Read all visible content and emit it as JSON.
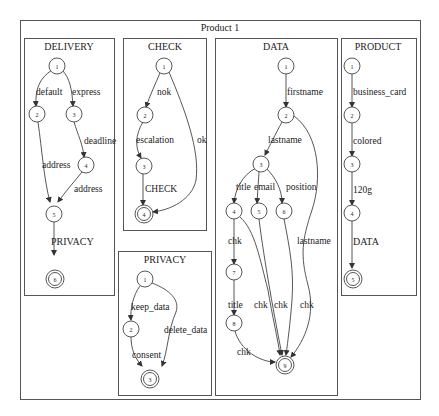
{
  "graph": {
    "title": "Product 1",
    "clusters": [
      {
        "name": "DELIVERY",
        "nodes": [
          {
            "id": "1",
            "final": false
          },
          {
            "id": "2",
            "final": false
          },
          {
            "id": "3",
            "final": false
          },
          {
            "id": "4",
            "final": false
          },
          {
            "id": "5",
            "final": false
          },
          {
            "id": "6",
            "final": true
          }
        ],
        "edges": [
          {
            "from": "1",
            "to": "2",
            "label": "default"
          },
          {
            "from": "1",
            "to": "3",
            "label": "express"
          },
          {
            "from": "3",
            "to": "4",
            "label": "deadline"
          },
          {
            "from": "2",
            "to": "5",
            "label": "address"
          },
          {
            "from": "4",
            "to": "5",
            "label": "address"
          },
          {
            "from": "5",
            "to": "6",
            "label": "PRIVACY"
          }
        ]
      },
      {
        "name": "CHECK",
        "nodes": [
          {
            "id": "1",
            "final": false
          },
          {
            "id": "2",
            "final": false
          },
          {
            "id": "3",
            "final": false
          },
          {
            "id": "4",
            "final": true
          }
        ],
        "edges": [
          {
            "from": "1",
            "to": "2",
            "label": "nok"
          },
          {
            "from": "2",
            "to": "3",
            "label": "escalation"
          },
          {
            "from": "3",
            "to": "4",
            "label": "CHECK"
          },
          {
            "from": "1",
            "to": "4",
            "label": "ok"
          }
        ]
      },
      {
        "name": "PRIVACY",
        "nodes": [
          {
            "id": "1",
            "final": false
          },
          {
            "id": "2",
            "final": false
          },
          {
            "id": "3",
            "final": true
          }
        ],
        "edges": [
          {
            "from": "1",
            "to": "2",
            "label": "keep_data"
          },
          {
            "from": "2",
            "to": "3",
            "label": "consent"
          },
          {
            "from": "1",
            "to": "3",
            "label": "delete_data"
          }
        ]
      },
      {
        "name": "DATA",
        "nodes": [
          {
            "id": "1",
            "final": false
          },
          {
            "id": "2",
            "final": false
          },
          {
            "id": "3",
            "final": false
          },
          {
            "id": "4",
            "final": false
          },
          {
            "id": "5",
            "final": false
          },
          {
            "id": "6",
            "final": false
          },
          {
            "id": "7",
            "final": false
          },
          {
            "id": "8",
            "final": false
          },
          {
            "id": "9",
            "final": true
          }
        ],
        "edges": [
          {
            "from": "1",
            "to": "2",
            "label": "firstname"
          },
          {
            "from": "2",
            "to": "3",
            "label": "lastname"
          },
          {
            "from": "3",
            "to": "4",
            "label": "title"
          },
          {
            "from": "3",
            "to": "5",
            "label": "email"
          },
          {
            "from": "3",
            "to": "6",
            "label": "position"
          },
          {
            "from": "4",
            "to": "7",
            "label": "chk"
          },
          {
            "from": "7",
            "to": "8",
            "label": "title"
          },
          {
            "from": "8",
            "to": "9",
            "label": "chk"
          },
          {
            "from": "4",
            "to": "9",
            "label": "chk"
          },
          {
            "from": "5",
            "to": "9",
            "label": "chk"
          },
          {
            "from": "6",
            "to": "9",
            "label": "chk"
          },
          {
            "from": "2",
            "to": "9",
            "label": "lastname"
          }
        ]
      },
      {
        "name": "PRODUCT",
        "nodes": [
          {
            "id": "1",
            "final": false
          },
          {
            "id": "2",
            "final": false
          },
          {
            "id": "3",
            "final": false
          },
          {
            "id": "4",
            "final": false
          },
          {
            "id": "5",
            "final": true
          }
        ],
        "edges": [
          {
            "from": "1",
            "to": "2",
            "label": "business_card"
          },
          {
            "from": "2",
            "to": "3",
            "label": "colored"
          },
          {
            "from": "3",
            "to": "4",
            "label": "120g"
          },
          {
            "from": "4",
            "to": "5",
            "label": "DATA"
          }
        ]
      }
    ]
  }
}
